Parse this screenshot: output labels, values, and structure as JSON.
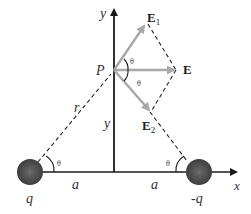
{
  "diagram": {
    "type": "electric-field-dipole",
    "colors": {
      "axis": "#1a1a1a",
      "field_vector": "#a8a8a8",
      "dashed": "#222222",
      "charge": "#4a4a4a",
      "charge_highlight": "#6a6a6a"
    },
    "axes": {
      "x_label": "x",
      "y_label": "y"
    },
    "point": {
      "label": "P"
    },
    "vectors": {
      "e1": {
        "label_main": "E",
        "label_sub": "1"
      },
      "e2": {
        "label_main": "E",
        "label_sub": "2"
      },
      "e_total": {
        "label": "E"
      }
    },
    "angles": {
      "theta_upper_p": "θ",
      "theta_lower_p": "θ",
      "theta_left_charge": "θ",
      "theta_right_charge": "θ"
    },
    "distances": {
      "r": "r",
      "y": "y",
      "a_left": "a",
      "a_right": "a"
    },
    "charges": {
      "left": {
        "label": "q",
        "sign": "+"
      },
      "right": {
        "label": "-q",
        "sign": "-"
      }
    }
  }
}
